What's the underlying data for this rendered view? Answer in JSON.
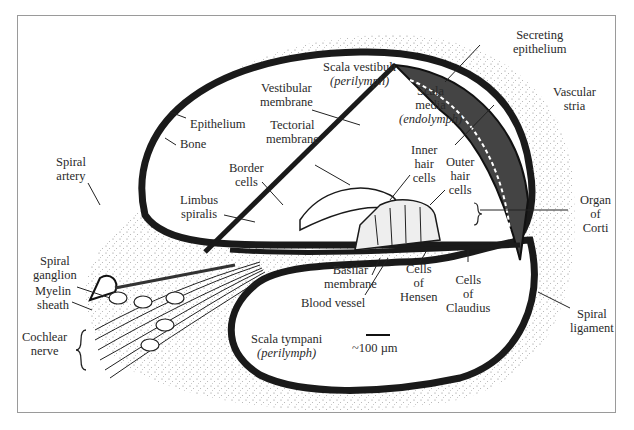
{
  "diagram": {
    "scale_bar": "~100 µm",
    "labels": {
      "scala_vestibuli": "Scala vestibuli",
      "scala_vestibuli_fluid": "(perilymph)",
      "secreting_epithelium_1": "Secreting",
      "secreting_epithelium_2": "epithelium",
      "vestibular_membrane_1": "Vestibular",
      "vestibular_membrane_2": "membrane",
      "scala_media_1": "Scala",
      "scala_media_2": "media",
      "scala_media_fluid": "(endolymph)",
      "vascular_stria_1": "Vascular",
      "vascular_stria_2": "stria",
      "epithelium": "Epithelium",
      "bone": "Bone",
      "tectorial_membrane_1": "Tectorial",
      "tectorial_membrane_2": "membrane",
      "spiral_artery_1": "Spiral",
      "spiral_artery_2": "artery",
      "border_cells_1": "Border",
      "border_cells_2": "cells",
      "inner_hair_cells_1": "Inner",
      "inner_hair_cells_2": "hair",
      "inner_hair_cells_3": "cells",
      "outer_hair_cells_1": "Outer",
      "outer_hair_cells_2": "hair",
      "outer_hair_cells_3": "cells",
      "limbus_spiralis_1": "Limbus",
      "limbus_spiralis_2": "spiralis",
      "organ_of_corti_1": "Organ",
      "organ_of_corti_2": "of",
      "organ_of_corti_3": "Corti",
      "spiral_ganglion_1": "Spiral",
      "spiral_ganglion_2": "ganglion",
      "myelin_sheath_1": "Myelin",
      "myelin_sheath_2": "sheath",
      "basilar_membrane_1": "Basilar",
      "basilar_membrane_2": "membrane",
      "cells_of_hensen_1": "Cells",
      "cells_of_hensen_2": "of",
      "cells_of_hensen_3": "Hensen",
      "cells_of_claudius_1": "Cells",
      "cells_of_claudius_2": "of",
      "cells_of_claudius_3": "Claudius",
      "blood_vessel": "Blood vessel",
      "cochlear_nerve_1": "Cochlear",
      "cochlear_nerve_2": "nerve",
      "spiral_ligament_1": "Spiral",
      "spiral_ligament_2": "ligament",
      "scala_tympani": "Scala tympani",
      "scala_tympani_fluid": "(perilymph)"
    }
  }
}
